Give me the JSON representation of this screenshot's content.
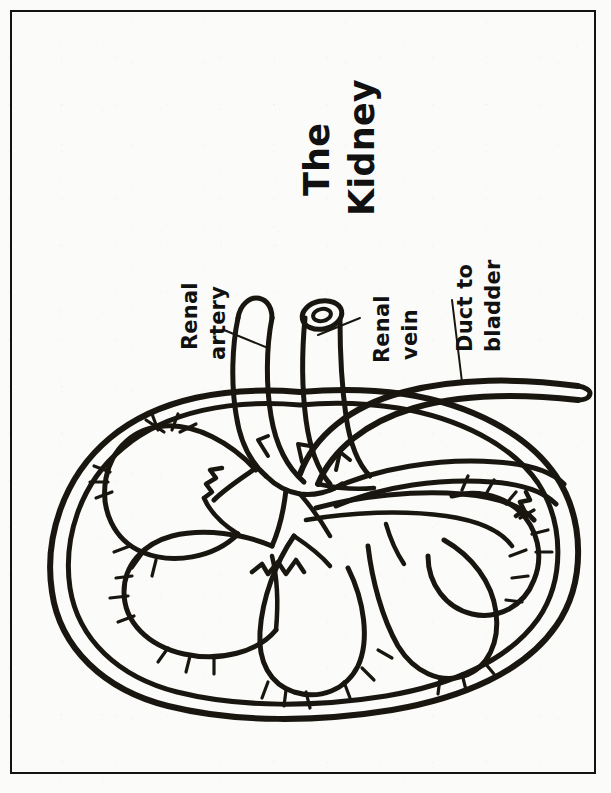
{
  "page": {
    "background_color": "#fbfbfa",
    "ink_color": "#18160f",
    "border_color": "#15130f"
  },
  "title": {
    "text_line1": "The",
    "text_line2": "Kidney",
    "orientation": "rotated-90-ccw"
  },
  "labels": [
    {
      "id": "renal-artery",
      "line1": "Renal",
      "line2": "artery",
      "orientation": "rotated-90-ccw",
      "points_to": "renal artery tube (rounded blind tip)"
    },
    {
      "id": "renal-vein",
      "line1": "Renal",
      "line2": "vein",
      "orientation": "rotated-90-ccw",
      "points_to": "renal vein tube (open circular cross-section)"
    },
    {
      "id": "duct-to-bladder",
      "line1": "Duct to",
      "line2": "bladder",
      "orientation": "rotated-90-ccw",
      "points_to": "ureter tube exiting to the right"
    }
  ],
  "diagram": {
    "name": "kidney-cross-section",
    "type": "line-drawing",
    "parts": [
      "renal capsule (double outline)",
      "renal cortex",
      "renal pyramids",
      "renal papillae",
      "renal pelvis",
      "renal artery",
      "renal vein",
      "ureter"
    ]
  }
}
